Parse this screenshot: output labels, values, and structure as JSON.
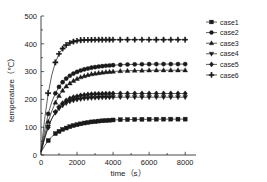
{
  "chart_data": {
    "type": "line",
    "title": "",
    "xlabel": "time（s）",
    "ylabel": "temperature（℃）",
    "xlim": [
      0,
      8600
    ],
    "ylim": [
      0,
      500
    ],
    "xticks": [
      0,
      2000,
      4000,
      6000,
      8000
    ],
    "yticks": [
      0,
      100,
      200,
      300,
      400,
      500
    ],
    "xtick_labels": [
      "0",
      "2000",
      "4000",
      "6000",
      "8000"
    ],
    "ytick_labels": [
      "0",
      "100",
      "200",
      "300",
      "400",
      "500"
    ],
    "grid": false,
    "legend_position": "right",
    "x": [
      0,
      200,
      400,
      600,
      800,
      1000,
      1200,
      1400,
      1600,
      1800,
      2000,
      2200,
      2400,
      2600,
      2800,
      3000,
      3200,
      3400,
      3600,
      3800,
      4000,
      4400,
      4800,
      5200,
      5600,
      6000,
      6400,
      6800,
      7200,
      7600,
      8000
    ],
    "series": [
      {
        "name": "case1",
        "marker": "square",
        "plateau": 129,
        "values": [
          10,
          33,
          52,
          66,
          77,
          85,
          92,
          97,
          102,
          106,
          109,
          112,
          115,
          117,
          119,
          120,
          122,
          123,
          124,
          125,
          126,
          127,
          127.5,
          128,
          128.3,
          128.6,
          128.8,
          129,
          129,
          129,
          129
        ]
      },
      {
        "name": "case2",
        "marker": "circle",
        "plateau": 327,
        "values": [
          12,
          88,
          148,
          191,
          222,
          245,
          262,
          275,
          285,
          293,
          299,
          304,
          308,
          311,
          314,
          316,
          318,
          319.5,
          321,
          322,
          323,
          324.5,
          325.5,
          326,
          326.4,
          326.7,
          327,
          327,
          327,
          327,
          327
        ]
      },
      {
        "name": "case3",
        "marker": "triangle-up",
        "plateau": 305,
        "values": [
          11,
          70,
          120,
          158,
          189,
          213,
          232,
          247,
          258,
          267,
          274,
          280,
          284,
          288,
          291,
          293,
          295,
          297,
          298.5,
          299.5,
          300.5,
          302,
          303,
          303.8,
          304.2,
          304.6,
          305,
          305,
          305,
          305,
          305
        ]
      },
      {
        "name": "case4",
        "marker": "triangle-down",
        "plateau": 208,
        "values": [
          10,
          62,
          102,
          131,
          152,
          167,
          178,
          186,
          192,
          196,
          199,
          201,
          203,
          204,
          205,
          205.6,
          206.2,
          206.6,
          207,
          207.2,
          207.5,
          207.8,
          208,
          208,
          208,
          208,
          208,
          208,
          208,
          208,
          208
        ]
      },
      {
        "name": "case5",
        "marker": "diamond",
        "plateau": 221,
        "values": [
          11,
          58,
          99,
          131,
          155,
          173,
          186,
          196,
          203,
          208,
          211,
          214,
          216,
          217.5,
          218.5,
          219.3,
          219.9,
          220.3,
          220.6,
          220.8,
          221,
          221,
          221,
          221,
          221,
          221,
          221,
          221,
          221,
          221,
          221
        ]
      },
      {
        "name": "case6",
        "marker": "cross",
        "plateau": 415,
        "values": [
          14,
          128,
          222,
          288,
          333,
          364,
          383,
          395,
          403,
          408,
          411,
          412.5,
          413.5,
          414,
          414.4,
          414.7,
          415,
          415,
          415,
          415,
          415,
          415,
          415,
          415,
          415,
          415,
          415,
          415,
          415,
          415,
          415
        ]
      }
    ],
    "legend": [
      {
        "label": "case1",
        "marker": "square"
      },
      {
        "label": "case2",
        "marker": "circle"
      },
      {
        "label": "case3",
        "marker": "triangle-up"
      },
      {
        "label": "case4",
        "marker": "triangle-down"
      },
      {
        "label": "case5",
        "marker": "diamond"
      },
      {
        "label": "case6",
        "marker": "cross"
      }
    ]
  }
}
